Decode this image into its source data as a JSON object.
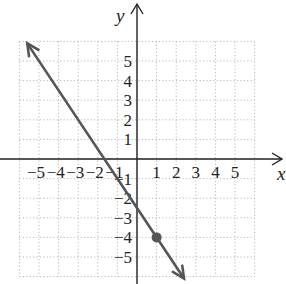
{
  "chart_data": {
    "type": "line",
    "title": "",
    "xlabel": "x",
    "ylabel": "y",
    "xlim": [
      -6,
      6
    ],
    "ylim": [
      -6,
      6
    ],
    "grid": true,
    "grid_style": "dotted",
    "x_ticks": [
      "-5",
      "-4",
      "-3",
      "-2",
      "-1",
      "1",
      "2",
      "3",
      "4",
      "5"
    ],
    "y_ticks": [
      "5",
      "4",
      "3",
      "2",
      "1",
      "-1",
      "-2",
      "-3",
      "-4",
      "-5"
    ],
    "series": [
      {
        "name": "line",
        "equation": "y = -1.5x - 2.5",
        "slope": -1.5,
        "intercept": -2.5,
        "x": [
          -5.6,
          2.4
        ],
        "y": [
          5.9,
          -6.1
        ],
        "arrows": "both",
        "color": "#555555"
      }
    ],
    "points": [
      {
        "x": 1,
        "y": -4,
        "color": "#555555"
      }
    ]
  },
  "labels": {
    "x_axis": "x",
    "y_axis": "y"
  }
}
